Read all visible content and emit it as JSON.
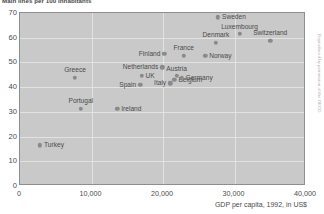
{
  "chart_data": {
    "type": "scatter",
    "title": "Main lines per 100 inhabitants",
    "xlabel": "GDP per capita, 1992, in US$",
    "ylabel": "Main lines per 100 inhabitants",
    "xlim": [
      0,
      40000
    ],
    "ylim": [
      0,
      70
    ],
    "grid": true,
    "legend": "none",
    "xticks": [
      "0",
      "10,000",
      "20,000",
      "30,000",
      "40,000"
    ],
    "xtick_values": [
      0,
      10000,
      20000,
      30000,
      40000
    ],
    "yticks": [
      "0",
      "10",
      "20",
      "30",
      "40",
      "50",
      "60",
      "70"
    ],
    "ytick_values": [
      0,
      10,
      20,
      30,
      40,
      50,
      60,
      70
    ],
    "points": [
      {
        "label": "Turkey",
        "x": 2800,
        "y": 16.5,
        "label_pos": "right"
      },
      {
        "label": "Greece",
        "x": 7700,
        "y": 43.8,
        "label_pos": "above"
      },
      {
        "label": "Portugal",
        "x": 8500,
        "y": 31.2,
        "label_pos": "above"
      },
      {
        "label": "Ireland",
        "x": 13600,
        "y": 31.2,
        "label_pos": "right"
      },
      {
        "label": "Spain",
        "x": 16800,
        "y": 41.0,
        "label_pos": "left"
      },
      {
        "label": "UK",
        "x": 17000,
        "y": 44.7,
        "label_pos": "right"
      },
      {
        "label": "Netherlands",
        "x": 19900,
        "y": 48.0,
        "label_pos": "left"
      },
      {
        "label": "Finland",
        "x": 20200,
        "y": 53.5,
        "label_pos": "left"
      },
      {
        "label": "Italy",
        "x": 21000,
        "y": 41.5,
        "label_pos": "left"
      },
      {
        "label": "Belgium",
        "x": 21600,
        "y": 43.0,
        "label_pos": "right"
      },
      {
        "label": "Austria",
        "x": 21900,
        "y": 44.5,
        "label_pos": "above"
      },
      {
        "label": "Germany",
        "x": 22600,
        "y": 43.8,
        "label_pos": "right"
      },
      {
        "label": "France",
        "x": 22900,
        "y": 52.7,
        "label_pos": "above"
      },
      {
        "label": "Norway",
        "x": 25900,
        "y": 52.7,
        "label_pos": "right"
      },
      {
        "label": "Denmark",
        "x": 27400,
        "y": 58.0,
        "label_pos": "above"
      },
      {
        "label": "Sweden",
        "x": 27700,
        "y": 68.2,
        "label_pos": "right"
      },
      {
        "label": "Luxembourg",
        "x": 30700,
        "y": 61.5,
        "label_pos": "above"
      },
      {
        "label": "Switzerland",
        "x": 35000,
        "y": 58.8,
        "label_pos": "above"
      }
    ],
    "colors": {
      "panel": "#c9c9c9",
      "grid": "#e2e2e2",
      "marker": "#8a8a8a",
      "text": "#4b4b4b",
      "border": "#8e8e8e"
    }
  },
  "side_credit": "Reproduced by permission of the OECD"
}
